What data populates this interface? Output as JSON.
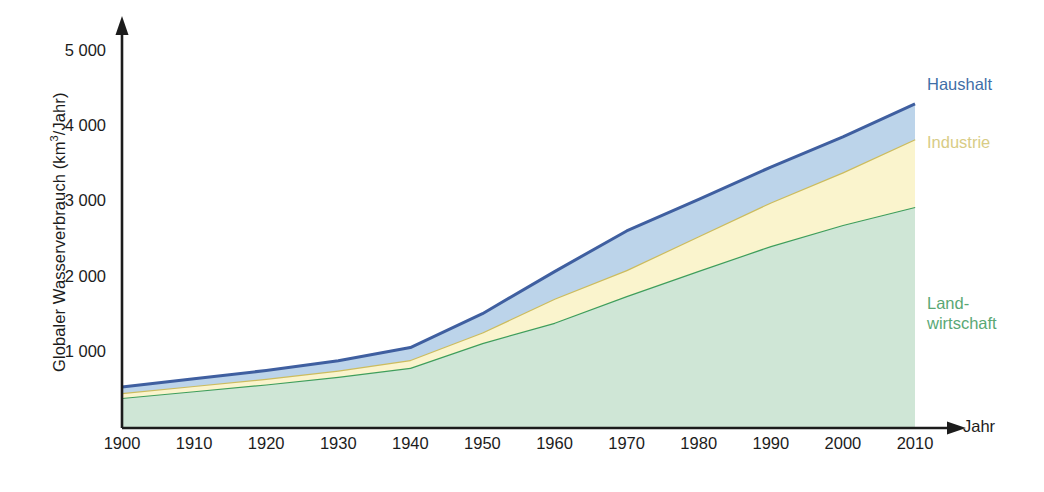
{
  "chart_data": {
    "type": "area",
    "stacked": true,
    "title": "",
    "subtitle": "",
    "xlabel": "Jahr",
    "ylabel": "Globaler Wasserverbrauch (km³/Jahr)",
    "x": [
      1900,
      1910,
      1920,
      1930,
      1940,
      1950,
      1960,
      1970,
      1980,
      1990,
      2000,
      2010
    ],
    "categories": [
      "1900",
      "1910",
      "1920",
      "1930",
      "1940",
      "1950",
      "1960",
      "1970",
      "1980",
      "1990",
      "2000",
      "2010"
    ],
    "xlim": [
      1900,
      2010
    ],
    "ylim": [
      0,
      5000
    ],
    "ytick_labels": [
      "1 000",
      "2 000",
      "3 000",
      "4 000",
      "5 000"
    ],
    "yticks": [
      1000,
      2000,
      3000,
      4000,
      5000
    ],
    "xtick_labels": [
      "1900",
      "1910",
      "1920",
      "1930",
      "1940",
      "1950",
      "1960",
      "1970",
      "1980",
      "1990",
      "2000",
      "2010"
    ],
    "grid": false,
    "legend_position": "right-inline",
    "series": [
      {
        "name": "Landwirtschaft",
        "label": "Land-\nwirtschaft",
        "fill_color": "#cfe6d6",
        "line_color": "#3f9e5c",
        "values": [
          400,
          490,
          580,
          680,
          800,
          1130,
          1400,
          1755,
          2090,
          2420,
          2700,
          2940
        ]
      },
      {
        "name": "Industrie",
        "label": "Industrie",
        "fill_color": "#faf4cd",
        "line_color": "#ccbc5e",
        "values": [
          65,
          70,
          75,
          85,
          105,
          140,
          320,
          345,
          460,
          580,
          700,
          900
        ]
      },
      {
        "name": "Haushalt",
        "label": "Haushalt",
        "fill_color": "#bcd4ea",
        "line_color": "#3f5fa0",
        "values": [
          80,
          95,
          110,
          130,
          165,
          250,
          360,
          520,
          490,
          470,
          470,
          470
        ]
      }
    ],
    "cumulative_totals": {
      "landwirtschaft": [
        400,
        490,
        580,
        680,
        800,
        1130,
        1400,
        1755,
        2090,
        2420,
        2700,
        2940
      ],
      "industrie_top": [
        465,
        560,
        655,
        765,
        905,
        1270,
        1720,
        2100,
        2550,
        3000,
        3400,
        3840
      ],
      "haushalt_top": [
        545,
        655,
        765,
        895,
        1070,
        1520,
        2080,
        2620,
        3040,
        3470,
        3870,
        4310
      ]
    },
    "axis_color": "#1c1c1c",
    "background_color": "#ffffff"
  }
}
